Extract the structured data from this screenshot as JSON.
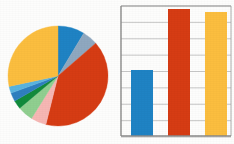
{
  "page": {
    "background_color": "#fdfdfc",
    "width": 234,
    "height": 144
  },
  "palette": {
    "blue": "#1f83c4",
    "steel_blue": "#8fa8c0",
    "red": "#d63c14",
    "pink": "#f6b7b4",
    "light_green": "#90cf90",
    "dark_green": "#128b3c",
    "medium_blue": "#2f7fc0",
    "light_blue": "#5ab4e0",
    "amber": "#fbbe3f",
    "gridline": "#b9b9b9",
    "frame": "#9a9a9a",
    "axis": "#8a8a8a"
  },
  "chart_data": [
    {
      "id": "pie-chart",
      "type": "pie",
      "title": "",
      "subtitle": "",
      "legend_position": "none",
      "grid": false,
      "center": [
        58,
        76
      ],
      "radius": 50,
      "start_angle_deg": 0,
      "direction": "clockwise",
      "categories": [
        "Slice 1",
        "Slice 2",
        "Slice 3",
        "Slice 4",
        "Slice 5",
        "Slice 6",
        "Slice 7",
        "Slice 8",
        "Slice 9"
      ],
      "values": [
        8.6,
        5.0,
        40.3,
        5.0,
        5.0,
        2.8,
        2.8,
        2.2,
        28.3
      ],
      "angles_deg": [
        31,
        18,
        145,
        18,
        18,
        10,
        10,
        8,
        102
      ],
      "colors": [
        "#1f83c4",
        "#8fa8c0",
        "#d63c14",
        "#f6b7b4",
        "#90cf90",
        "#128b3c",
        "#2f7fc0",
        "#5ab4e0",
        "#fbbe3f"
      ],
      "labels_shown": false
    },
    {
      "id": "bar-chart",
      "type": "bar",
      "title": "",
      "subtitle": "",
      "xlabel": "",
      "ylabel": "",
      "legend_position": "none",
      "grid": true,
      "grid_axis": "y",
      "gridline_count": 8,
      "ylim": [
        0,
        8
      ],
      "yticks": [
        0,
        1,
        2,
        3,
        4,
        5,
        6,
        7,
        8
      ],
      "ytick_labels": [
        "",
        "",
        "",
        "",
        "",
        "",
        "",
        "",
        ""
      ],
      "categories": [
        "A",
        "B",
        "C"
      ],
      "xtick_labels": [
        "",
        "",
        ""
      ],
      "values": [
        4.2,
        7.9,
        7.7
      ],
      "colors": [
        "#1f83c4",
        "#d63c14",
        "#fbbe3f"
      ],
      "plot_area": {
        "x": 5,
        "y": 6,
        "width": 110,
        "height": 131
      },
      "bar_geometry": [
        {
          "x": 10,
          "top": 70,
          "width": 22
        },
        {
          "x": 47,
          "top": 9,
          "width": 22
        },
        {
          "x": 84,
          "top": 12,
          "width": 22
        }
      ],
      "baseline_y": 136
    }
  ]
}
